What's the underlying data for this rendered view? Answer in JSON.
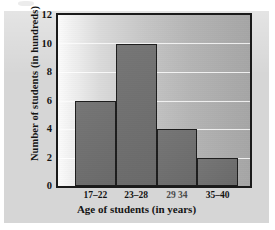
{
  "figure": {
    "background_color": "#ffffff",
    "panel_color": "#d6d6d6",
    "frame_color": "#1a1a1a",
    "bar_color": "#6f6f6f",
    "gridline_color": "#ffffff"
  },
  "chart_data": {
    "type": "bar",
    "title": "",
    "xlabel": "Age of students (in years)",
    "ylabel": "Number of students (in hundreds)",
    "categories": [
      "17–22",
      "23–28",
      "29 34",
      "35–40"
    ],
    "values": [
      6,
      10,
      4,
      2
    ],
    "ylim": [
      0,
      12
    ],
    "yticks": [
      0,
      2,
      4,
      6,
      8,
      10,
      12
    ],
    "ytick_labels": [
      "0",
      "2",
      "4",
      "6",
      "8",
      "10",
      "12"
    ],
    "grid": "horizontal",
    "legend": "none"
  }
}
